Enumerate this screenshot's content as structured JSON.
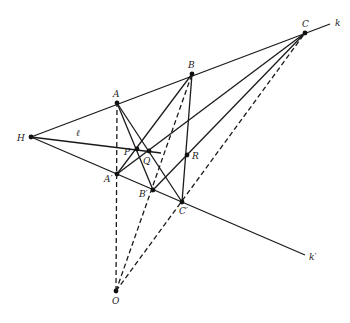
{
  "diagram": {
    "title": "",
    "points": {
      "H": {
        "label": "H",
        "x": 31,
        "y": 137,
        "lx": 17,
        "ly": 141
      },
      "A": {
        "label": "A",
        "x": 117,
        "y": 103,
        "lx": 113,
        "ly": 97
      },
      "B": {
        "label": "B",
        "x": 192,
        "y": 74,
        "lx": 188,
        "ly": 68
      },
      "C": {
        "label": "C",
        "x": 305,
        "y": 33,
        "lx": 302,
        "ly": 27
      },
      "A1": {
        "label": "A′",
        "x": 117,
        "y": 174,
        "lx": 104,
        "ly": 182
      },
      "B1": {
        "label": "B′",
        "x": 153,
        "y": 190,
        "lx": 139,
        "ly": 197
      },
      "C1": {
        "label": "C′",
        "x": 182,
        "y": 202,
        "lx": 179,
        "ly": 214
      },
      "P": {
        "label": "P",
        "x": 137,
        "y": 149,
        "lx": 124,
        "ly": 155
      },
      "Q": {
        "label": "Q",
        "x": 149,
        "y": 151,
        "lx": 143,
        "ly": 164
      },
      "R": {
        "label": "R",
        "x": 187,
        "y": 155,
        "lx": 192,
        "ly": 159
      },
      "O": {
        "label": "O",
        "x": 116,
        "y": 291,
        "lx": 112,
        "ly": 304
      }
    },
    "line_labels": {
      "k": {
        "label": "k",
        "x": 335,
        "y": 26
      },
      "k_prime": {
        "label": "k′",
        "x": 309,
        "y": 260
      },
      "ell": {
        "label": "ℓ",
        "x": 76,
        "y": 136
      }
    },
    "solid_lines": [
      {
        "name": "line-k",
        "x1": 31,
        "y1": 137,
        "x2": 330,
        "y2": 24
      },
      {
        "name": "line-k-prime",
        "x1": 31,
        "y1": 137,
        "x2": 305,
        "y2": 255
      },
      {
        "name": "line-ell",
        "x1": 31,
        "y1": 137,
        "x2": 161,
        "y2": 153
      },
      {
        "name": "line-A-B1",
        "x1": 117,
        "y1": 103,
        "x2": 153,
        "y2": 190
      },
      {
        "name": "line-A-C1",
        "x1": 117,
        "y1": 103,
        "x2": 182,
        "y2": 202
      },
      {
        "name": "line-B-A1",
        "x1": 192,
        "y1": 74,
        "x2": 117,
        "y2": 174
      },
      {
        "name": "line-B-C1",
        "x1": 192,
        "y1": 74,
        "x2": 182,
        "y2": 202
      },
      {
        "name": "line-C-A1",
        "x1": 305,
        "y1": 33,
        "x2": 117,
        "y2": 174
      },
      {
        "name": "line-C-B1",
        "x1": 305,
        "y1": 33,
        "x2": 153,
        "y2": 190
      }
    ],
    "dashed_lines": [
      {
        "name": "line-O-A",
        "x1": 116,
        "y1": 291,
        "x2": 117,
        "y2": 103
      },
      {
        "name": "line-O-B",
        "x1": 116,
        "y1": 291,
        "x2": 192,
        "y2": 74
      },
      {
        "name": "line-O-C",
        "x1": 116,
        "y1": 291,
        "x2": 305,
        "y2": 33
      }
    ],
    "colors": {
      "ink": "#1a1a1a",
      "background": "#ffffff"
    }
  }
}
